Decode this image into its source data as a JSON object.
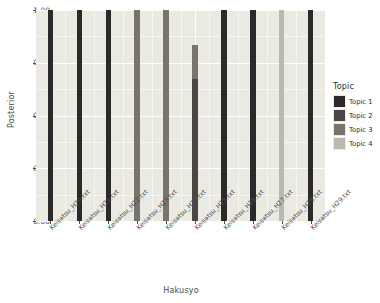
{
  "chart_data": {
    "type": "bar",
    "title": "",
    "xlabel": "Hakusyo",
    "ylabel": "Posterior",
    "ylim": [
      0,
      1
    ],
    "ytick_labels": [
      "0.00",
      "0.25",
      "0.50",
      "0.75",
      "1.00"
    ],
    "ytick_values": [
      0,
      0.25,
      0.5,
      0.75,
      1
    ],
    "grid": true,
    "legend_position": "right",
    "legend_title": "Topic",
    "categories": [
      "Keisatsu_H20.txt",
      "Keisatsu_H21.txt",
      "Keisatsu_H22.txt",
      "Keisatsu_H23.txt",
      "Keisatsu_H24.txt",
      "Keisatsu_H25.txt",
      "Keisatsu_H26.txt",
      "Keisatsu_H27.txt",
      "Keisatsu_H28.txt",
      "Keisatsu_H29.txt"
    ],
    "series": [
      {
        "name": "Topic 1",
        "color": "#2c2a28",
        "values": [
          1.0,
          1.0,
          1.0,
          0.0,
          0.0,
          0.0,
          1.0,
          1.0,
          0.0,
          1.0
        ]
      },
      {
        "name": "Topic 2",
        "color": "#4a4744",
        "values": [
          0.0,
          0.0,
          0.0,
          0.0,
          0.0,
          0.675,
          0.0,
          0.0,
          0.0,
          0.0
        ]
      },
      {
        "name": "Topic 3",
        "color": "#77746e",
        "values": [
          0.0,
          0.0,
          0.0,
          1.0,
          1.0,
          0.16,
          0.0,
          0.0,
          0.0,
          0.0
        ]
      },
      {
        "name": "Topic 4",
        "color": "#b9b8b1",
        "values": [
          0.0,
          0.0,
          0.0,
          0.0,
          0.0,
          0.0,
          0.0,
          0.0,
          1.0,
          0.0
        ]
      }
    ]
  },
  "legend": {
    "title": "Topic",
    "items": [
      {
        "label": "Topic 1",
        "color": "#2c2a28"
      },
      {
        "label": "Topic 2",
        "color": "#4a4744"
      },
      {
        "label": "Topic 3",
        "color": "#77746e"
      },
      {
        "label": "Topic 4",
        "color": "#b9b8b1"
      }
    ]
  },
  "panel": {
    "background": "#eaeae3",
    "grid_major_color": "#ffffff",
    "grid_minor_color": "#f6f6f2"
  },
  "axes": {
    "x_title": "Hakusyo",
    "y_title": "Posterior"
  }
}
